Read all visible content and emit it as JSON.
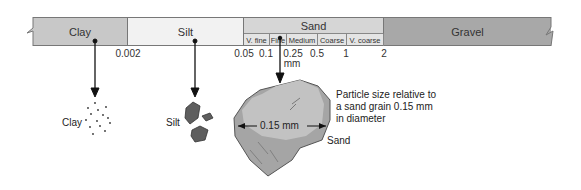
{
  "scale_bar": {
    "segments": [
      {
        "name": "Clay",
        "color": "#c8c8c8"
      },
      {
        "name": "Silt",
        "color": "#f2f2f2"
      },
      {
        "name": "Sand",
        "color": "#d6d6d6"
      },
      {
        "name": "Gravel",
        "color": "#a8a8a8"
      }
    ],
    "sand_subdivisions": [
      "V. fine",
      "Fine",
      "Medium",
      "Coarse",
      "V. coarse"
    ],
    "ticks": [
      "0.002",
      "0.05",
      "0.1",
      "0.25",
      "0.5",
      "1",
      "2"
    ],
    "unit": "mm"
  },
  "particles": {
    "clay_label": "Clay",
    "silt_label": "Silt",
    "sand_label": "Sand",
    "measurement": "0.15 mm",
    "caption_lines": [
      "Particle size relative to",
      "a sand grain 0.15 mm",
      "in diameter"
    ]
  }
}
